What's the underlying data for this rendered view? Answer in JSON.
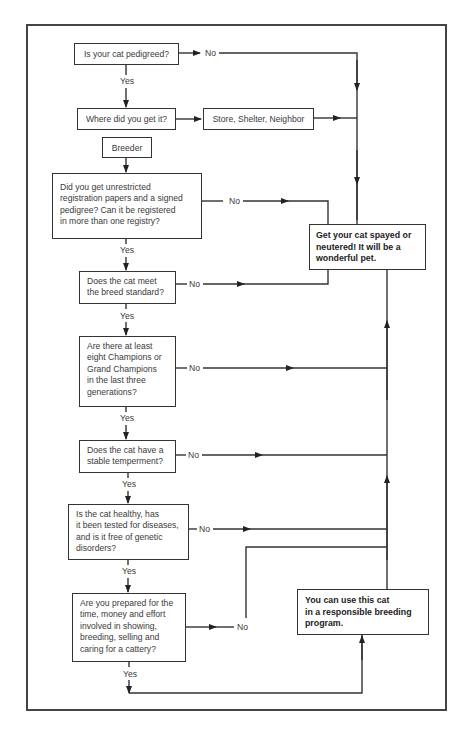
{
  "diagram": {
    "nodes": {
      "q_pedigreed": "Is your cat pedigreed?",
      "q_where": "Where did you get it?",
      "store_shelter": "Store, Shelter, Neighbor",
      "breeder": "Breeder",
      "q_papers": "Did you get unrestricted\nregistration papers and a signed\npedigree? Can it be registered\nin more than one registry?",
      "result_spay": "Get your cat spayed or\nneutered! It will be a\nwonderful pet.",
      "q_standard": "Does the cat meet\nthe breed standard?",
      "q_champions": "Are there at least\neight Champions or\nGrand Champions\nin the last three\ngenerations?",
      "q_temperament": "Does the cat have a\nstable temperment?",
      "q_healthy": "Is the cat healthy, has\nit been tested for diseases,\nand is it free of genetic\ndisorders?",
      "q_prepared": "Are you prepared for the\ntime, money and effort\ninvolved in showing,\nbreeding, selling and\ncaring for a cattery?",
      "result_breed": "You can use this cat\nin a responsible breeding\nprogram."
    },
    "labels": {
      "yes": "Yes",
      "no": "No"
    },
    "edges": [
      {
        "from": "q_pedigreed",
        "to": "result_spay",
        "label": "No"
      },
      {
        "from": "q_pedigreed",
        "to": "q_where",
        "label": "Yes"
      },
      {
        "from": "q_where",
        "to": "store_shelter",
        "label": ""
      },
      {
        "from": "store_shelter",
        "to": "result_spay",
        "label": ""
      },
      {
        "from": "q_where",
        "to": "breeder",
        "label": ""
      },
      {
        "from": "breeder",
        "to": "q_papers",
        "label": ""
      },
      {
        "from": "q_papers",
        "to": "result_spay",
        "label": "No"
      },
      {
        "from": "q_papers",
        "to": "q_standard",
        "label": "Yes"
      },
      {
        "from": "q_standard",
        "to": "result_spay",
        "label": "No"
      },
      {
        "from": "q_standard",
        "to": "q_champions",
        "label": "Yes"
      },
      {
        "from": "q_champions",
        "to": "result_spay",
        "label": "No"
      },
      {
        "from": "q_champions",
        "to": "q_temperament",
        "label": "Yes"
      },
      {
        "from": "q_temperament",
        "to": "result_spay",
        "label": "No"
      },
      {
        "from": "q_temperament",
        "to": "q_healthy",
        "label": "Yes"
      },
      {
        "from": "q_healthy",
        "to": "result_spay",
        "label": "No"
      },
      {
        "from": "q_healthy",
        "to": "q_prepared",
        "label": "Yes"
      },
      {
        "from": "q_prepared",
        "to": "result_spay",
        "label": "No"
      },
      {
        "from": "q_prepared",
        "to": "result_breed",
        "label": "Yes"
      }
    ]
  }
}
